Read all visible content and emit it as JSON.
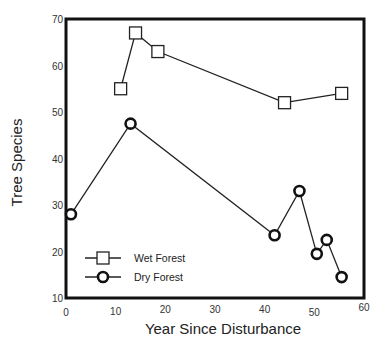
{
  "chart_data": {
    "type": "line",
    "title": "",
    "xlabel": "Year Since Disturbance",
    "ylabel": "Tree Species",
    "xlim": [
      0,
      60
    ],
    "ylim": [
      10,
      70
    ],
    "xticks": [
      0,
      10,
      20,
      30,
      40,
      50,
      60
    ],
    "yticks": [
      10,
      20,
      30,
      40,
      50,
      60,
      70
    ],
    "grid": false,
    "legend_position": "lower left (inside plot)",
    "series": [
      {
        "name": "Wet Forest",
        "marker": "square",
        "x": [
          11,
          14,
          18.5,
          44,
          55.5
        ],
        "y": [
          55,
          67,
          63,
          52,
          54
        ]
      },
      {
        "name": "Dry Forest",
        "marker": "circle",
        "x": [
          1,
          13,
          42,
          47,
          50.5,
          52.5,
          55.5
        ],
        "y": [
          28,
          47.5,
          23.5,
          33,
          19.5,
          22.5,
          14.5
        ]
      }
    ]
  },
  "frame": {
    "left": 66,
    "top": 19,
    "right": 364,
    "bottom": 298,
    "color": "#111111"
  }
}
